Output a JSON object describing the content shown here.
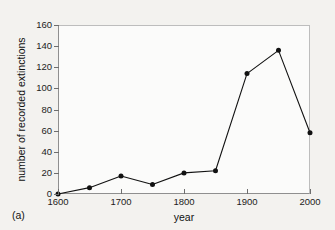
{
  "chart_data": {
    "type": "line",
    "title": "",
    "panel_label": "(a)",
    "xlabel": "year",
    "ylabel": "number of recorded extinctions",
    "x": [
      1600,
      1650,
      1700,
      1750,
      1800,
      1850,
      1900,
      1950,
      2000
    ],
    "values": [
      0,
      6,
      17,
      9,
      20,
      22,
      114,
      136,
      58
    ],
    "series": [
      {
        "name": "recorded extinctions",
        "values": [
          0,
          6,
          17,
          9,
          20,
          22,
          114,
          136,
          58
        ]
      }
    ],
    "xlim": [
      1600,
      2000
    ],
    "ylim": [
      0,
      160
    ],
    "xtick_labels": [
      "1600",
      "1700",
      "1800",
      "1900",
      "2000"
    ],
    "xticks": [
      1600,
      1700,
      1800,
      1900,
      2000
    ],
    "ytick_labels": [
      "0",
      "20",
      "40",
      "60",
      "80",
      "100",
      "120",
      "140",
      "160"
    ],
    "yticks": [
      0,
      20,
      40,
      60,
      80,
      100,
      120,
      140,
      160
    ],
    "grid": false,
    "legend": "none",
    "marker": "filled-circle",
    "line_color": "#121212",
    "marker_color": "#111111",
    "frame_color": "#8f8f8f",
    "plot_background": "#fbfbfa",
    "figure_background": "#f3f2ef"
  }
}
